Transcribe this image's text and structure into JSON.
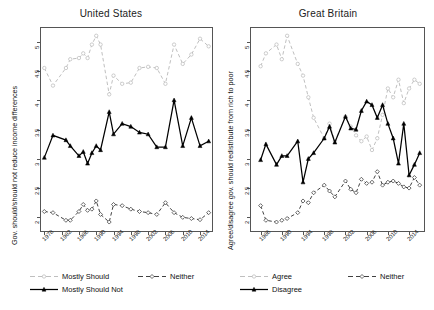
{
  "figure": {
    "width": 434,
    "height": 310,
    "background": "#ffffff",
    "axis_color": "#555555"
  },
  "panels": [
    {
      "id": "united-states",
      "title": "United States",
      "ylabel": "Gov. should/should not reduce income differences",
      "xlabel": "",
      "ylim": [
        1.75,
        5.25
      ],
      "yticks": [
        "2",
        "2.5",
        "3",
        "3.5",
        "4",
        "4.5",
        "5"
      ],
      "ytick_values": [
        2,
        2.5,
        3,
        3.5,
        4,
        4.5,
        5
      ],
      "xticks": [
        "1978",
        "1982",
        "1986",
        "1990",
        "1994",
        "1998",
        "2002",
        "2006",
        "2010",
        "2014"
      ],
      "xtick_values": [
        1978,
        1982,
        1986,
        1990,
        1994,
        1998,
        2002,
        2006,
        2010,
        2014
      ],
      "xlim": [
        1977,
        2017
      ],
      "legend": [
        {
          "label": "Mostly Should",
          "key": "mostly_should",
          "color": "#b8b8b8",
          "dash": "4,3",
          "marker": "open-circle"
        },
        {
          "label": "Neither",
          "key": "neither",
          "color": "#2b2b2b",
          "dash": "4,3",
          "marker": "open-diamond"
        },
        {
          "label": "Mostly Should Not",
          "key": "mostly_should_not",
          "color": "#000000",
          "dash": "none",
          "marker": "filled-triangle"
        }
      ]
    },
    {
      "id": "great-britain",
      "title": "Great Britain",
      "ylabel": "Agree/disagree gov. should redistribute from rich to poor",
      "xlabel": "",
      "ylim": [
        1.75,
        5.25
      ],
      "yticks": [
        "2",
        "2.5",
        "3",
        "3.5",
        "4",
        "4.5",
        "5"
      ],
      "ytick_values": [
        2,
        2.5,
        3,
        3.5,
        4,
        4.5,
        5
      ],
      "xticks": [
        "1986",
        "1990",
        "1994",
        "1998",
        "2002",
        "2006",
        "2010",
        "2014"
      ],
      "xtick_values": [
        1986,
        1990,
        1994,
        1998,
        2002,
        2006,
        2010,
        2014
      ],
      "xlim": [
        1984,
        2017
      ],
      "legend": [
        {
          "label": "Agree",
          "key": "agree",
          "color": "#b8b8b8",
          "dash": "4,3",
          "marker": "open-circle"
        },
        {
          "label": "Neither",
          "key": "neither",
          "color": "#2b2b2b",
          "dash": "4,3",
          "marker": "open-diamond"
        },
        {
          "label": "Disagree",
          "key": "disagree",
          "color": "#000000",
          "dash": "none",
          "marker": "filled-triangle"
        }
      ]
    }
  ],
  "chart_data": [
    {
      "type": "line",
      "panel": "United States",
      "title": "United States",
      "xlabel": "",
      "ylabel": "Gov. should/should not reduce income differences",
      "xlim": [
        1977,
        2017
      ],
      "ylim": [
        1.75,
        5.25
      ],
      "grid": false,
      "legend_position": "below",
      "x": [
        1978,
        1980,
        1983,
        1984,
        1986,
        1987,
        1988,
        1989,
        1990,
        1991,
        1993,
        1994,
        1996,
        1998,
        2000,
        2002,
        2004,
        2006,
        2008,
        2010,
        2012,
        2014,
        2016
      ],
      "series": [
        {
          "name": "Mostly Should",
          "color": "#b8b8b8",
          "style": "dashed",
          "marker": "open-circle",
          "values": [
            4.55,
            4.25,
            4.55,
            4.7,
            4.72,
            4.8,
            4.72,
            4.95,
            5.1,
            4.95,
            4.1,
            4.42,
            4.28,
            4.3,
            4.55,
            4.57,
            4.55,
            4.28,
            4.95,
            4.62,
            4.78,
            5.05,
            4.92
          ]
        },
        {
          "name": "Neither",
          "color": "#2b2b2b",
          "style": "dashed",
          "marker": "open-diamond",
          "values": [
            2.1,
            2.08,
            1.95,
            1.95,
            2.1,
            2.22,
            2.12,
            2.14,
            2.28,
            2.05,
            1.92,
            2.22,
            2.2,
            2.14,
            2.1,
            2.08,
            2.05,
            2.25,
            2.08,
            2.0,
            1.98,
            1.96,
            2.08
          ]
        },
        {
          "name": "Mostly Should Not",
          "color": "#000000",
          "style": "solid",
          "marker": "filled-triangle",
          "values": [
            3.02,
            3.4,
            3.32,
            3.22,
            3.05,
            3.12,
            2.92,
            3.1,
            3.22,
            3.15,
            3.8,
            3.42,
            3.6,
            3.55,
            3.45,
            3.42,
            3.2,
            3.2,
            4.0,
            3.22,
            3.7,
            3.22,
            3.3
          ]
        }
      ]
    },
    {
      "type": "line",
      "panel": "Great Britain",
      "title": "Great Britain",
      "xlabel": "",
      "ylabel": "Agree/disagree gov. should redistribute from rich to poor",
      "xlim": [
        1984,
        2017
      ],
      "ylim": [
        1.75,
        5.25
      ],
      "grid": false,
      "legend_position": "below",
      "x": [
        1986,
        1987,
        1989,
        1990,
        1991,
        1993,
        1994,
        1995,
        1996,
        1998,
        1999,
        2000,
        2002,
        2003,
        2004,
        2005,
        2006,
        2007,
        2008,
        2009,
        2010,
        2011,
        2012,
        2013,
        2014,
        2015,
        2016
      ],
      "series": [
        {
          "name": "Agree",
          "color": "#b8b8b8",
          "style": "dashed",
          "marker": "open-circle",
          "values": [
            4.58,
            4.8,
            4.95,
            4.7,
            5.1,
            4.62,
            4.42,
            4.05,
            3.7,
            3.35,
            3.6,
            3.3,
            3.72,
            3.55,
            3.4,
            3.3,
            3.38,
            3.15,
            3.35,
            3.75,
            4.2,
            4.05,
            4.35,
            3.95,
            4.2,
            4.35,
            4.28
          ]
        },
        {
          "name": "Neither",
          "color": "#2b2b2b",
          "style": "dashed",
          "marker": "open-diamond",
          "values": [
            2.2,
            1.95,
            1.92,
            1.95,
            1.98,
            2.08,
            2.28,
            2.25,
            2.42,
            2.55,
            2.45,
            2.35,
            2.62,
            2.48,
            2.42,
            2.65,
            2.58,
            2.6,
            2.78,
            2.55,
            2.6,
            2.62,
            2.58,
            2.52,
            2.5,
            2.68,
            2.55
          ]
        },
        {
          "name": "Disagree",
          "color": "#000000",
          "style": "solid",
          "marker": "filled-triangle",
          "values": [
            2.98,
            3.25,
            2.9,
            3.05,
            3.05,
            3.3,
            2.6,
            3.0,
            3.1,
            3.35,
            3.55,
            3.28,
            3.72,
            3.52,
            3.5,
            3.82,
            3.98,
            3.92,
            3.7,
            3.92,
            3.6,
            3.35,
            2.92,
            3.6,
            2.72,
            2.9,
            3.1
          ]
        }
      ]
    }
  ]
}
